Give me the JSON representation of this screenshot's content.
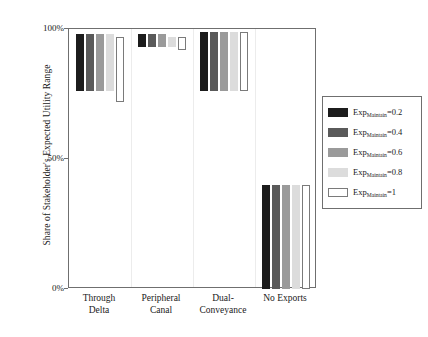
{
  "chart_data": {
    "type": "bar",
    "title": "",
    "xlabel": "",
    "ylabel": "Share of Stakeholder's Expected Utility Range",
    "ylim": [
      0,
      100
    ],
    "ytick_labels": [
      "100%",
      "50%",
      "0%"
    ],
    "ytick_values": [
      100,
      50,
      0
    ],
    "grid": false,
    "legend_position": "right",
    "bar_style": "floating-range",
    "categories": [
      "Through\nDelta",
      "Peripheral\nCanal",
      "Dual-\nConveyance",
      "No Exports"
    ],
    "category_labels": [
      {
        "line1": "Through",
        "line2": "Delta"
      },
      {
        "line1": "Peripheral",
        "line2": "Canal"
      },
      {
        "line1": "Dual-",
        "line2": "Conveyance"
      },
      {
        "line1": "No Exports",
        "line2": ""
      }
    ],
    "series": [
      {
        "name": "Exp_Maintain=0.2",
        "exp_value": "0.2",
        "color": "#1c1c1c",
        "tops": [
          98,
          98,
          99,
          40
        ],
        "bottoms": [
          76,
          93,
          76,
          0
        ]
      },
      {
        "name": "Exp_Maintain=0.4",
        "exp_value": "0.4",
        "color": "#5a5a5a",
        "tops": [
          98,
          98,
          99,
          40
        ],
        "bottoms": [
          76,
          93,
          76,
          0
        ]
      },
      {
        "name": "Exp_Maintain=0.6",
        "exp_value": "0.6",
        "color": "#9a9a9a",
        "tops": [
          98,
          98,
          99,
          40
        ],
        "bottoms": [
          76,
          93,
          76,
          0
        ]
      },
      {
        "name": "Exp_Maintain=0.8",
        "exp_value": "0.8",
        "color": "#dcdcdc",
        "tops": [
          98,
          97,
          99,
          40
        ],
        "bottoms": [
          76,
          93,
          76,
          0
        ]
      },
      {
        "name": "Exp_Maintain=1",
        "exp_value": "1",
        "color": "#ffffff",
        "tops": [
          97,
          97,
          99,
          40
        ],
        "bottoms": [
          72,
          92,
          76,
          0
        ]
      }
    ]
  },
  "legend": {
    "prefix": "Exp",
    "subscript": "Maintain",
    "items": [
      {
        "label": "=0.2",
        "color": "#1c1c1c",
        "open": false
      },
      {
        "label": "=0.4",
        "color": "#5a5a5a",
        "open": false
      },
      {
        "label": "=0.6",
        "color": "#9a9a9a",
        "open": false
      },
      {
        "label": "=0.8",
        "color": "#dcdcdc",
        "open": false
      },
      {
        "label": "=1",
        "color": "#ffffff",
        "open": true
      }
    ]
  },
  "axis": {
    "y_title": "Share of Stakeholder's Expected Utility Range",
    "y_ticks": [
      "100%",
      "50%",
      "0%"
    ]
  }
}
